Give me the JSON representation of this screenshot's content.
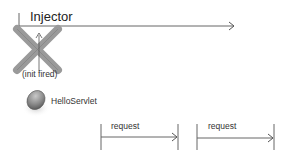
{
  "diagram": {
    "type": "sequence-timeline",
    "lifeline": {
      "label": "Injector",
      "arrow_end": "open-arrowhead"
    },
    "destroyed_marker": {
      "icon": "x-cross-icon",
      "note": "(init fired)"
    },
    "servlet": {
      "label": "HelloServlet",
      "icon": "sphere-icon"
    },
    "messages": [
      {
        "label": "request"
      },
      {
        "label": "request"
      }
    ],
    "colors": {
      "line": "#666666",
      "cross": "#9a9a9a",
      "sphere": "#8a8a8a",
      "text": "#333333"
    }
  }
}
